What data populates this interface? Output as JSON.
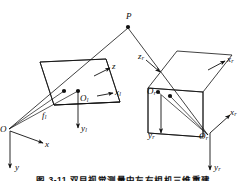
{
  "figure": {
    "type": "line-diagram",
    "background_color": "#ffffff",
    "stroke_color": "#111111",
    "caption": "图 3-11  双目视觉测量中左右相机三维重建"
  },
  "points": {
    "scene_point": {
      "label": "P",
      "sub": "",
      "x": 128,
      "y": 21
    },
    "left_principal_point": {
      "label": "O",
      "sub": "l",
      "x": 80,
      "y": 99
    },
    "left_optical_center": {
      "label": "O",
      "sub": "",
      "x": 5,
      "y": 130
    },
    "right_principal_point": {
      "label": "O",
      "sub": "r",
      "x": 160,
      "y": 94
    },
    "right_optical_center": {
      "label": "O",
      "sub": "r",
      "x": 210,
      "y": 137
    }
  },
  "axis_labels": [
    {
      "name": "left-plane-z-axis",
      "label": "z",
      "sub": "",
      "x": 112,
      "y": 65
    },
    {
      "name": "left-plane-x-axis",
      "label": "x",
      "sub": "l",
      "x": 113,
      "y": 100
    },
    {
      "name": "left-plane-y-axis",
      "label": "y",
      "sub": "l",
      "x": 83,
      "y": 130
    },
    {
      "name": "world-x-axis",
      "label": "x",
      "sub": "",
      "x": 45,
      "y": 145
    },
    {
      "name": "world-y-axis",
      "label": "y",
      "sub": "",
      "x": 22,
      "y": 167
    },
    {
      "name": "focal-length-left",
      "label": "f",
      "sub": "l",
      "x": 46,
      "y": 117
    },
    {
      "name": "right-plane-z-axis",
      "label": "z",
      "sub": "r",
      "x": 143,
      "y": 61
    },
    {
      "name": "right-plane-x-axis",
      "label": "x",
      "sub": "r",
      "x": 228,
      "y": 65
    },
    {
      "name": "right-plane-y-axis",
      "label": "y",
      "sub": "r",
      "x": 149,
      "y": 137
    },
    {
      "name": "right-cam-x-axis",
      "label": "x",
      "sub": "r",
      "x": 228,
      "y": 120
    },
    {
      "name": "right-cam-y-axis",
      "label": "y",
      "sub": "r",
      "x": 214,
      "y": 167
    }
  ],
  "shapes": {
    "left_image_plane": "41,62 107,59 107,116 41,119",
    "right_image_plane": "148,88 178,51 232,55 202,92",
    "note_left_plane": "quadrilateral tilted image plane of left camera",
    "note_right_plane": "quadrilateral tilted image plane of right camera"
  },
  "rays": {
    "left_ray": "P to left optical center O through left image plane",
    "right_ray": "P to right optical center O_r through right image plane"
  }
}
